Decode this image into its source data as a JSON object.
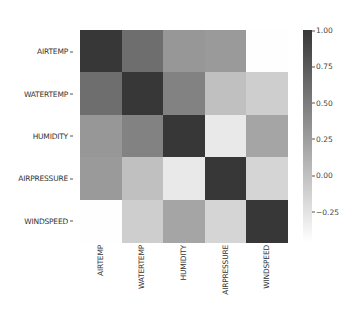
{
  "chart_data": {
    "type": "heatmap",
    "title": "",
    "xlabel": "",
    "ylabel": "",
    "x_categories": [
      "AIRTEMP",
      "WATERTEMP",
      "HUMIDITY",
      "AIRPRESSURE",
      "WINDSPEED"
    ],
    "y_categories": [
      "AIRTEMP",
      "WATERTEMP",
      "HUMIDITY",
      "AIRPRESSURE",
      "WINDSPEED"
    ],
    "values": [
      [
        1.0,
        0.6,
        0.3,
        0.28,
        -0.45
      ],
      [
        0.6,
        1.0,
        0.45,
        0.0,
        -0.1
      ],
      [
        0.3,
        0.45,
        1.0,
        -0.3,
        0.2
      ],
      [
        0.28,
        0.0,
        -0.3,
        1.0,
        -0.15
      ],
      [
        -0.45,
        -0.1,
        0.2,
        -0.15,
        1.0
      ]
    ],
    "colormap": "greys (light = low, dark = high)",
    "colorbar": {
      "ticks": [
        1.0,
        0.75,
        0.5,
        0.25,
        0.0,
        -0.25
      ],
      "tick_labels": [
        "1.00",
        "0.75",
        "0.50",
        "0.25",
        "0.00",
        "−0.25"
      ],
      "range": [
        -0.46,
        1.0
      ]
    },
    "grid": false,
    "legend_position": "right (colorbar)"
  }
}
